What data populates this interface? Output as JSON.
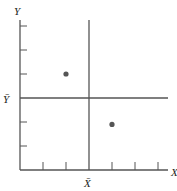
{
  "chart_data": {
    "type": "scatter",
    "title": "",
    "xlabel": "X",
    "ylabel": "Y",
    "x_mean_label": "X̄",
    "y_mean_label": "Ȳ",
    "xlim": [
      0,
      6.5
    ],
    "ylim": [
      0,
      6.2
    ],
    "x_ticks": [
      1,
      2,
      3,
      4,
      5,
      6
    ],
    "y_ticks": [
      1,
      2,
      3,
      4,
      5,
      6
    ],
    "x_mean": 3,
    "y_mean": 3,
    "grid": false,
    "legend": null,
    "points": [
      {
        "x": 2,
        "y": 4
      },
      {
        "x": 4,
        "y": 1.9
      }
    ],
    "reference_lines": [
      {
        "orientation": "vertical",
        "at": "x_mean",
        "value": 3
      },
      {
        "orientation": "horizontal",
        "at": "y_mean",
        "value": 3
      }
    ]
  },
  "colors": {
    "axis": "#555555",
    "line": "#555555",
    "point": "#555555",
    "text": "#222222"
  }
}
